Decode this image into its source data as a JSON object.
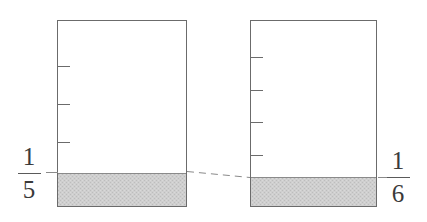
{
  "figure": {
    "background_color": "#ffffff",
    "stroke_color": "#6b6b6b",
    "shade_fill": "#c9c9c9",
    "shade_stroke": "#8a8a8a",
    "dash_color": "#8a8a8a",
    "label_color": "#3a3a3a"
  },
  "diagrams": [
    {
      "name": "left-bar",
      "fraction": {
        "numerator": "1",
        "denominator": "5"
      },
      "label_position": "left",
      "divisions": 5,
      "shaded_parts": 1,
      "rect": {
        "x": 57,
        "y": 20,
        "width": 130,
        "height": 187
      },
      "shade_top_y": 173,
      "ticks_y": [
        66,
        104,
        142
      ],
      "tick_length": 12
    },
    {
      "name": "right-bar",
      "fraction": {
        "numerator": "1",
        "denominator": "6"
      },
      "label_position": "right",
      "divisions": 6,
      "shaded_parts": 1,
      "rect": {
        "x": 250,
        "y": 20,
        "width": 127,
        "height": 187
      },
      "shade_top_y": 177,
      "ticks_y": [
        57,
        90,
        122,
        155
      ],
      "tick_length": 12
    }
  ],
  "connector": {
    "name": "dashed-comparison-line",
    "from": {
      "x": 187,
      "y": 171
    },
    "to": {
      "x": 250,
      "y": 177
    },
    "style": "dashed"
  }
}
